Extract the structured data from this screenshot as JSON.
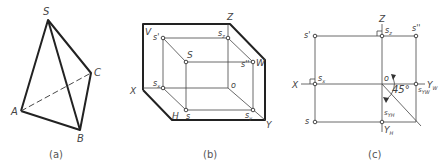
{
  "figure_a": {
    "caption": "(a)",
    "vertices": {
      "S": "S",
      "A": "A",
      "B": "B",
      "C": "C"
    }
  },
  "figure_b": {
    "caption": "(b)",
    "labels": {
      "V": "V",
      "Z": "Z",
      "X": "X",
      "Y": "Y",
      "H": "H",
      "W": "W",
      "s_prime": "s'",
      "s_z": "s",
      "s_z_sub": "z",
      "S": "S",
      "s_double_prime": "s''",
      "s_x": "s",
      "s_x_sub": "x",
      "o": "o",
      "s": "s",
      "s_y": "s",
      "s_y_sub": "y"
    }
  },
  "figure_c": {
    "caption": "(c)",
    "labels": {
      "Z": "Z",
      "X": "X",
      "Y_W": "Y",
      "Y_W_sub": "W",
      "Y_H": "Y",
      "Y_H_sub": "H",
      "s_prime": "s'",
      "s_z": "s",
      "s_z_sub": "z",
      "s_double_prime": "s''",
      "s_x": "s",
      "s_x_sub": "x",
      "o": "o",
      "s_yw": "s",
      "s_yw_sub": "YW",
      "s": "s",
      "s_yh": "s",
      "s_yh_sub": "YH",
      "angle": "45°"
    }
  }
}
